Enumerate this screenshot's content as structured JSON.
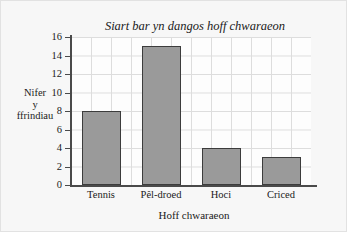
{
  "chart_data": {
    "type": "bar",
    "title": "Siart bar yn dangos hoff chwaraeon",
    "xlabel": "Hoff chwaraeon",
    "ylabel": "Nifer y ffrindiau",
    "ylabel_lines": [
      "Nifer",
      "y",
      "ffrindiau"
    ],
    "categories": [
      "Tennis",
      "Pêl-droed",
      "Hoci",
      "Criced"
    ],
    "values": [
      8,
      15,
      4,
      3
    ],
    "ylim": [
      0,
      16
    ],
    "ytick_step": 2,
    "yticks": [
      0,
      2,
      4,
      6,
      8,
      10,
      12,
      14,
      16
    ],
    "ytick_labels": [
      "0",
      "2",
      "4",
      "6",
      "8",
      "10",
      "12",
      "14",
      "16"
    ],
    "grid": true,
    "legend": "none",
    "bar_color": "#9a9a9a",
    "bar_edge_color": "#3c3c3c",
    "grid_color": "#dddddd",
    "axis_color": "#4a4a4a",
    "background_color": "#f7f7f7",
    "plot_background_color": "#fdfdfd"
  }
}
